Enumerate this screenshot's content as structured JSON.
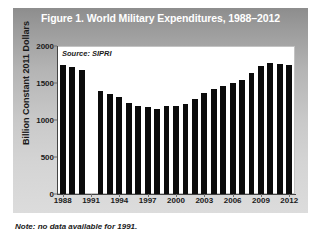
{
  "figure": {
    "title": "Figure 1. World Military Expenditures, 1988–2012",
    "note": "Note: no data available for 1991.",
    "source_label": "Source: SIPRI"
  },
  "chart_data": {
    "type": "bar",
    "title": "Figure 1. World Military Expenditures, 1988–2012",
    "xlabel": "",
    "ylabel": "Billion Constant 2011 Dollars",
    "ylim": [
      0,
      2000
    ],
    "yticks": [
      0,
      500,
      1000,
      1500,
      2000
    ],
    "ytick_labels": [
      "0",
      "500",
      "1000",
      "1500",
      "2000"
    ],
    "xticks": [
      1988,
      1991,
      1994,
      1997,
      2000,
      2003,
      2006,
      2009,
      2012
    ],
    "xtick_labels": [
      "1988",
      "1991",
      "1994",
      "1997",
      "2000",
      "2003",
      "2006",
      "2009",
      "2012"
    ],
    "grid": false,
    "legend": "none",
    "bar_color": "#0b0b0b",
    "annotations": [
      "Source: SIPRI",
      "Note: no data available for 1991."
    ],
    "categories": [
      1988,
      1989,
      1990,
      1991,
      1992,
      1993,
      1994,
      1995,
      1996,
      1997,
      1998,
      1999,
      2000,
      2001,
      2002,
      2003,
      2004,
      2005,
      2006,
      2007,
      2008,
      2009,
      2010,
      2011,
      2012
    ],
    "values": [
      1750,
      1715,
      1680,
      null,
      1390,
      1350,
      1310,
      1230,
      1185,
      1180,
      1155,
      1185,
      1190,
      1215,
      1290,
      1370,
      1420,
      1455,
      1500,
      1545,
      1630,
      1735,
      1765,
      1760,
      1750
    ]
  }
}
